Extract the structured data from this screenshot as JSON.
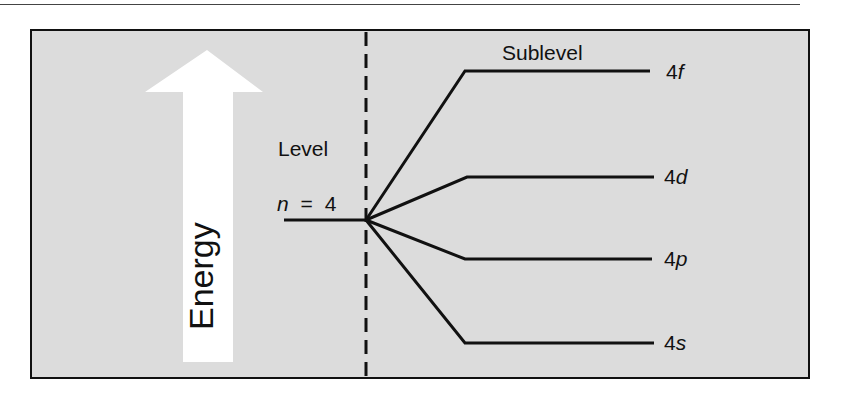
{
  "diagram": {
    "type": "energy-level-diagram",
    "energy_axis_label": "Energy",
    "level_label": "Level",
    "level": {
      "symbol": "n",
      "equals": "=",
      "value": "4"
    },
    "sublevel_heading": "Sublevel",
    "sublevels": [
      {
        "principal": "4",
        "letter": "f"
      },
      {
        "principal": "4",
        "letter": "d"
      },
      {
        "principal": "4",
        "letter": "p"
      },
      {
        "principal": "4",
        "letter": "s"
      }
    ],
    "colors": {
      "panel_bg": "#dcdcdc",
      "line": "#111111",
      "arrow": "#ffffff"
    }
  }
}
